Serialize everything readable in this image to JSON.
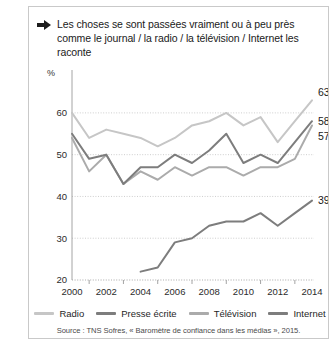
{
  "title": {
    "icon": "arrow-right-icon",
    "text": "Les choses se sont passées vraiment ou à peu près comme le journal / la radio / la télévision / Internet les raconte"
  },
  "chart_data": {
    "type": "line",
    "title": "Les choses se sont passées vraiment ou à peu près comme le journal / la radio / la télévision / Internet les raconte",
    "xlabel": "",
    "ylabel": "%",
    "ylim": [
      20,
      65
    ],
    "xlim": [
      2000,
      2014
    ],
    "grid": true,
    "legend_position": "bottom",
    "x": [
      2000,
      2001,
      2002,
      2003,
      2004,
      2005,
      2006,
      2007,
      2008,
      2009,
      2010,
      2011,
      2012,
      2013,
      2014
    ],
    "y_ticks": [
      20,
      30,
      40,
      50,
      60
    ],
    "x_ticks": [
      2000,
      2002,
      2004,
      2006,
      2008,
      2010,
      2012,
      2014
    ],
    "x_minor_ticks": [
      2001,
      2003,
      2005,
      2007,
      2009,
      2011,
      2013
    ],
    "series": [
      {
        "name": "Radio",
        "color": "#c6c6c6",
        "values": [
          60,
          54,
          56,
          55,
          54,
          52,
          54,
          57,
          58,
          60,
          57,
          59,
          53,
          58,
          63
        ],
        "end_label": "63"
      },
      {
        "name": "Presse écrite",
        "color": "#7d7d7d",
        "values": [
          55,
          49,
          50,
          43,
          47,
          47,
          50,
          48,
          51,
          55,
          48,
          50,
          48,
          53,
          58
        ],
        "end_label": "58"
      },
      {
        "name": "Télévision",
        "color": "#ababab",
        "values": [
          54,
          46,
          50,
          43,
          46,
          44,
          47,
          45,
          47,
          47,
          45,
          47,
          47,
          49,
          57
        ],
        "end_label": "57"
      },
      {
        "name": "Internet",
        "color": "#7d7d7d",
        "values": [
          null,
          null,
          null,
          null,
          22,
          23,
          29,
          30,
          33,
          34,
          34,
          36,
          33,
          36,
          39
        ],
        "end_label": "39"
      }
    ]
  },
  "axis": {
    "unit_label": "%",
    "y_tick_labels": [
      "60",
      "50",
      "40",
      "30",
      "20"
    ],
    "x_tick_labels": [
      "2000",
      "2002",
      "2004",
      "2006",
      "2008",
      "2010",
      "2012",
      "2014"
    ]
  },
  "end_labels": [
    {
      "value": "63",
      "series": "Radio"
    },
    {
      "value": "58",
      "series": "Presse écrite"
    },
    {
      "value": "57",
      "series": "Télévision"
    },
    {
      "value": "39",
      "series": "Internet"
    }
  ],
  "legend": {
    "items": [
      {
        "label": "Radio",
        "color": "#c6c6c6"
      },
      {
        "label": "Presse écrite",
        "color": "#7d7d7d"
      },
      {
        "label": "Télévision",
        "color": "#ababab"
      },
      {
        "label": "Internet",
        "color": "#7d7d7d"
      }
    ]
  },
  "source": {
    "text": "Source : TNS Sofres, « Baromètre de confiance dans les médias », 2015."
  }
}
